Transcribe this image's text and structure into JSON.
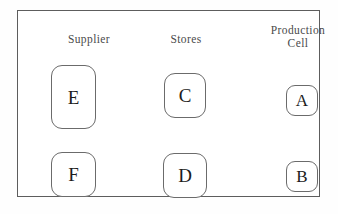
{
  "diagram": {
    "frame": {
      "name": "outer-boundary",
      "stroke_color": "#5d5d5d"
    },
    "columns": [
      {
        "id": "supplier",
        "label": "Supplier"
      },
      {
        "id": "stores",
        "label": "Stores"
      },
      {
        "id": "production_cell",
        "label": "Production\nCell"
      }
    ],
    "nodes": [
      {
        "id": "e",
        "label": "E",
        "column": "supplier",
        "row": "top"
      },
      {
        "id": "f",
        "label": "F",
        "column": "supplier",
        "row": "bottom"
      },
      {
        "id": "c",
        "label": "C",
        "column": "stores",
        "row": "top"
      },
      {
        "id": "d",
        "label": "D",
        "column": "stores",
        "row": "bottom"
      },
      {
        "id": "a",
        "label": "A",
        "column": "production_cell",
        "row": "top"
      },
      {
        "id": "b",
        "label": "B",
        "column": "production_cell",
        "row": "bottom"
      }
    ],
    "colors": {
      "background": "#ffffff",
      "node_stroke": "#6b6b6b",
      "node_fill": "#ffffff",
      "label_text": "#4a4a4a",
      "node_text": "#1c1c1c"
    }
  }
}
